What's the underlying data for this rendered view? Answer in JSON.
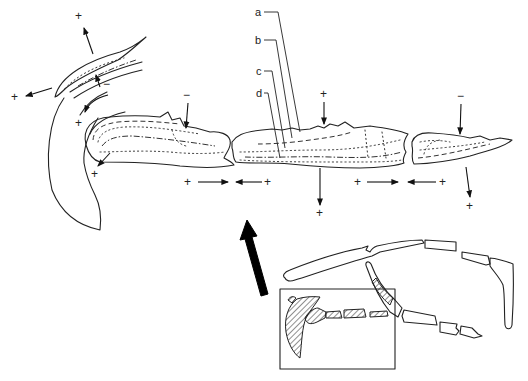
{
  "figure": {
    "type": "scientific-diagram",
    "labels": {
      "a": "a",
      "b": "b",
      "c": "c",
      "d": "d"
    },
    "signs": {
      "plus": "+",
      "minus": "−"
    },
    "markers": [
      {
        "id": "top-left-upper",
        "sign": "+"
      },
      {
        "id": "top-left-left",
        "sign": "+"
      },
      {
        "id": "hook-inner-minus",
        "sign": "−"
      },
      {
        "id": "hook-inner-plus",
        "sign": "+"
      },
      {
        "id": "tip-plus",
        "sign": "+"
      },
      {
        "id": "segment1-top-minus",
        "sign": "−"
      },
      {
        "id": "segment2-top-plus",
        "sign": "+"
      },
      {
        "id": "segment3-top-minus",
        "sign": "−"
      },
      {
        "id": "joint1-left-plus",
        "sign": "+"
      },
      {
        "id": "joint1-right-plus",
        "sign": "+"
      },
      {
        "id": "segment2-bottom-plus",
        "sign": "+"
      },
      {
        "id": "joint2-left-plus",
        "sign": "+"
      },
      {
        "id": "joint2-right-plus",
        "sign": "+"
      },
      {
        "id": "segment3-bottom-plus",
        "sign": "+"
      }
    ],
    "inset": {
      "description": "Skeletal overview with boxed hatched region showing location of the enlarged section",
      "big_arrow_direction": "up-left"
    },
    "colors": {
      "line": "#222222",
      "background": "#ffffff",
      "arrow_fill": "#000000"
    }
  }
}
